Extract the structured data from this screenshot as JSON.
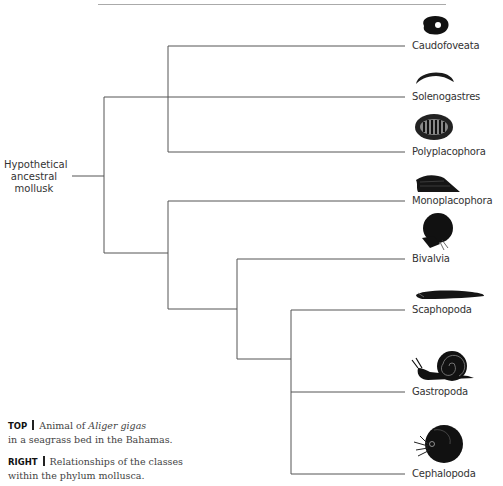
{
  "figure": {
    "root_label": "Hypothetical ancestral mollusk",
    "classes": [
      {
        "name": "Caudofoveata",
        "icon": "caudofoveata-worm-icon"
      },
      {
        "name": "Solenogastres",
        "icon": "solenogastres-worm-icon"
      },
      {
        "name": "Polyplacophora",
        "icon": "chiton-icon"
      },
      {
        "name": "Monoplacophora",
        "icon": "monoplacophoran-icon"
      },
      {
        "name": "Bivalvia",
        "icon": "clam-icon"
      },
      {
        "name": "Scaphopoda",
        "icon": "tusk-shell-icon"
      },
      {
        "name": "Gastropoda",
        "icon": "snail-icon"
      },
      {
        "name": "Cephalopoda",
        "icon": "nautilus-icon"
      }
    ]
  },
  "captions": {
    "top": {
      "tag": "TOP",
      "text_before": "Animal of ",
      "italic": "Aliger gigas",
      "text_after": " in a seagrass bed in the Bahamas."
    },
    "right": {
      "tag": "RIGHT",
      "text": "Relationships of the classes within the phylum mollusca."
    }
  }
}
